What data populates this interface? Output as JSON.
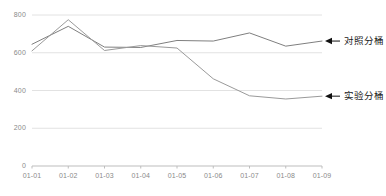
{
  "chart_data": {
    "type": "line",
    "title": "",
    "xlabel": "",
    "ylabel": "",
    "x": [
      "01-01",
      "01-02",
      "01-03",
      "01-04",
      "01-05",
      "01-06",
      "01-07",
      "01-08",
      "01-09"
    ],
    "categories": [
      "01-01",
      "01-02",
      "01-03",
      "01-04",
      "01-05",
      "01-06",
      "01-07",
      "01-08",
      "01-09"
    ],
    "ylim": [
      0,
      800
    ],
    "xlim": [
      0,
      8
    ],
    "yticks": [
      0,
      200,
      400,
      600,
      800
    ],
    "ytick_labels": [
      "0",
      "200",
      "400",
      "600",
      "800"
    ],
    "grid": true,
    "grid_axis": "y",
    "legend": "annotations-right",
    "series": [
      {
        "name": "对照分桶",
        "color": "#7f7f7f",
        "values": [
          645,
          740,
          630,
          628,
          665,
          662,
          705,
          635,
          662
        ]
      },
      {
        "name": "实验分桶",
        "color": "#9a9a9a",
        "values": [
          610,
          775,
          612,
          638,
          625,
          462,
          372,
          355,
          370
        ]
      }
    ],
    "annotations": [
      {
        "text": "对照分桶",
        "points_to_series": "对照分桶",
        "arrow": "left"
      },
      {
        "text": "实验分桶",
        "points_to_series": "实验分桶",
        "arrow": "left"
      }
    ]
  },
  "axis_colors": {
    "grid": "#e2e2e2",
    "axis": "#bdbdbd",
    "tick_text": "#8a8a8a"
  }
}
